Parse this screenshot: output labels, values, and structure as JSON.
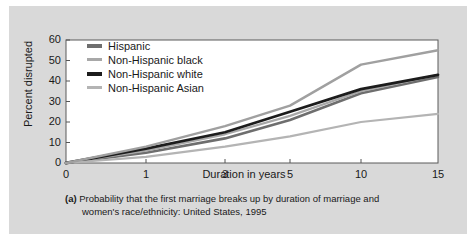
{
  "figure": {
    "background_color": "#d9d9d9",
    "plot_background_color": "#ffffff",
    "axis_color": "#555555"
  },
  "caption": {
    "tag": "(a)",
    "line1": "Probability that the first marriage breaks up by duration of marriage and",
    "line2": "women's race/ethnicity: United States, 1995"
  },
  "chart_data": {
    "type": "line",
    "title": "",
    "xlabel": "Duration in years",
    "ylabel": "Percent disrupted",
    "x": [
      0,
      1,
      3,
      5,
      10,
      15
    ],
    "x_tick_labels": [
      "0",
      "1",
      "3",
      "5",
      "10",
      "15"
    ],
    "x_axis_scale": "non-linear-category",
    "y_ticks": [
      0,
      10,
      20,
      30,
      40,
      50,
      60
    ],
    "y_tick_labels": [
      "0",
      "10",
      "20",
      "30",
      "40",
      "50",
      "60"
    ],
    "ylim": [
      0,
      60
    ],
    "grid": false,
    "legend_position": "upper-left-inside",
    "series": [
      {
        "name": "Hispanic",
        "color": "#6e6e6e",
        "width": 2.6,
        "values": [
          0,
          5,
          12,
          21,
          34,
          42
        ]
      },
      {
        "name": "Non-Hispanic black",
        "color": "#a8a8a8",
        "width": 2.2,
        "values": [
          0,
          6,
          14,
          23,
          35,
          43
        ]
      },
      {
        "name": "Non-Hispanic white",
        "color": "#1c1c1c",
        "width": 2.8,
        "values": [
          0,
          7,
          15,
          25,
          36,
          43
        ]
      },
      {
        "name": "Non-Hispanic Asian",
        "color": "#b4b4b4",
        "width": 2.2,
        "values": [
          0,
          3,
          8,
          13,
          20,
          24
        ]
      },
      {
        "name": "Non-Hispanic Asian upper",
        "color": "#a0a0a0",
        "width": 2.4,
        "hidden_from_legend": true,
        "values": [
          0,
          8,
          18,
          28,
          48,
          55
        ]
      }
    ]
  }
}
